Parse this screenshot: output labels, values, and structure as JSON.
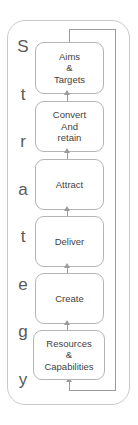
{
  "diagram": {
    "title_vertical": "Strategy",
    "strategy_letters": [
      "S",
      "t",
      "r",
      "a",
      "t",
      "e",
      "g",
      "y"
    ],
    "colors": {
      "box_border": "#b4b4b4",
      "box_fill": "#ffffff",
      "outer_border": "#c9c9c9",
      "arrow": "#9a9a9a",
      "text": "#3f3f3f",
      "label_text": "#5a5a5a"
    },
    "boxes": [
      {
        "id": "aims-targets",
        "lines": [
          "Aims",
          "&",
          "Targets"
        ]
      },
      {
        "id": "convert-and-retain",
        "lines": [
          "Convert",
          "And",
          "retain"
        ]
      },
      {
        "id": "attract",
        "lines": [
          "Attract"
        ]
      },
      {
        "id": "deliver",
        "lines": [
          "Deliver"
        ]
      },
      {
        "id": "create",
        "lines": [
          "Create"
        ]
      },
      {
        "id": "resources-capabilities",
        "lines": [
          "Resources",
          "&",
          "Capabilities"
        ]
      }
    ]
  },
  "chart_data": {
    "type": "diagram",
    "subtype": "vertical-process-flow-with-feedback-loop",
    "direction": "bottom-to-top",
    "nodes": [
      {
        "order": 1,
        "label": "Resources & Capabilities"
      },
      {
        "order": 2,
        "label": "Create"
      },
      {
        "order": 3,
        "label": "Deliver"
      },
      {
        "order": 4,
        "label": "Attract"
      },
      {
        "order": 5,
        "label": "Convert And retain"
      },
      {
        "order": 6,
        "label": "Aims & Targets"
      }
    ],
    "edges": [
      {
        "from": "Resources & Capabilities",
        "to": "Create",
        "style": "arrow-up"
      },
      {
        "from": "Create",
        "to": "Deliver",
        "style": "arrow-up"
      },
      {
        "from": "Deliver",
        "to": "Attract",
        "style": "arrow-up"
      },
      {
        "from": "Attract",
        "to": "Convert And retain",
        "style": "arrow-up"
      },
      {
        "from": "Convert And retain",
        "to": "Aims & Targets",
        "style": "arrow-up"
      },
      {
        "from": "Aims & Targets",
        "to": "Resources & Capabilities",
        "style": "feedback-loop-right-side"
      }
    ]
  }
}
